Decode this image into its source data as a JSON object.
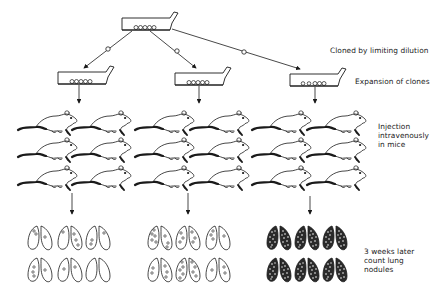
{
  "diagram": {
    "type": "experimental-workflow",
    "colors": {
      "ink": "#1a1a1a",
      "background": "#ffffff"
    },
    "labels": {
      "step1": "Cloned by limiting dilution",
      "step2": "Expansion of clones",
      "step3_lines": [
        "Injection",
        "intravenously",
        "in mice"
      ],
      "step4_lines": [
        "3 weeks later",
        "count lung",
        "nodules"
      ]
    },
    "nodes": {
      "parent_flask": {
        "icon": "culture-flask-icon",
        "cells": 5
      },
      "clone_flasks": [
        {
          "icon": "culture-flask-icon",
          "cells": 5
        },
        {
          "icon": "culture-flask-icon",
          "cells": 5
        },
        {
          "icon": "culture-flask-icon",
          "cells": 5
        }
      ],
      "mouse_groups": [
        {
          "icon": "mouse-icon",
          "count": 6
        },
        {
          "icon": "mouse-icon",
          "count": 6
        },
        {
          "icon": "mouse-icon",
          "count": 6
        }
      ],
      "lung_groups": [
        {
          "icon": "lung-icon",
          "pairs": 6,
          "nodule_density": "low"
        },
        {
          "icon": "lung-icon",
          "pairs": 6,
          "nodule_density": "medium"
        },
        {
          "icon": "lung-icon",
          "pairs": 6,
          "nodule_density": "high"
        }
      ]
    },
    "single_cell_marker": "o"
  }
}
